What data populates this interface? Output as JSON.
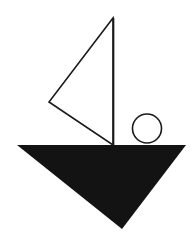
{
  "figure": {
    "background_color": "#ffffff",
    "canvas": {
      "width": 195,
      "height": 246
    },
    "shapes": [
      {
        "name": "sail-triangle",
        "kind": "triangle",
        "style": "outlined",
        "fill_color": "#ffffff",
        "stroke_color": "#1a1a1a",
        "stroke_width": 1.6,
        "points": "113,18 49,102 113,145",
        "vertices": [
          {
            "label": "apex",
            "x": 113,
            "y": 18
          },
          {
            "label": "left",
            "x": 49,
            "y": 102
          },
          {
            "label": "base",
            "x": 113,
            "y": 145
          }
        ]
      },
      {
        "name": "mast-line",
        "kind": "line",
        "style": "stroke",
        "stroke_color": "#1a1a1a",
        "stroke_width": 1.7,
        "x1": 113.5,
        "y1": 18,
        "x2": 113.5,
        "y2": 146
      },
      {
        "name": "sun-circle",
        "kind": "circle",
        "style": "outlined",
        "fill_color": "#ffffff",
        "stroke_color": "#1a1a1a",
        "stroke_width": 1.6,
        "center_x": 147,
        "center_y": 128.5,
        "radius": 14.5
      },
      {
        "name": "hull-triangle",
        "kind": "triangle",
        "style": "solid",
        "fill_color": "#131313",
        "points": "17,145 186,145 122,229",
        "vertices": [
          {
            "label": "top-left",
            "x": 17,
            "y": 145
          },
          {
            "label": "top-right",
            "x": 186,
            "y": 145
          },
          {
            "label": "bottom-point",
            "x": 122,
            "y": 229
          }
        ]
      }
    ]
  }
}
